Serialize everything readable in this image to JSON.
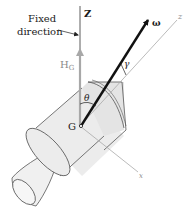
{
  "diagram": {
    "labels": {
      "fixed_direction_line1": "Fixed",
      "fixed_direction_line2": "direction",
      "Z_axis": "Z",
      "H_G_main": "H",
      "H_G_sub": "G",
      "omega": "ω",
      "z_axis": "z",
      "x_axis": "x",
      "gamma": "γ",
      "theta": "θ",
      "G_point": "G"
    },
    "colors": {
      "ink": "#1a1a1a",
      "axis_gray": "#9a9a9a",
      "body_fill": "#ececec",
      "body_stroke": "#555555",
      "hg_arrow": "#a8a8a8"
    }
  }
}
